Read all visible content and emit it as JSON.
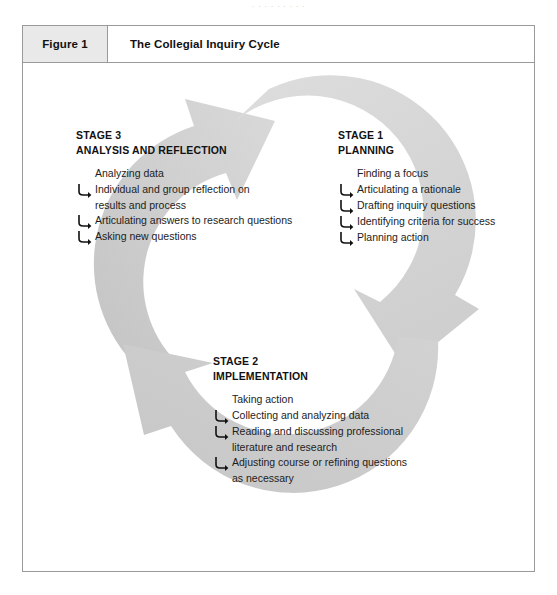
{
  "page": {
    "top_sliver_text": "· · · · · · · · ·",
    "background": "#ffffff"
  },
  "caption": {
    "number": "Figure 1",
    "title": "The Collegial Inquiry Cycle",
    "number_bg": "#e9e9e9",
    "border_color": "#9a9a9a"
  },
  "colors": {
    "arrow_light": "#d6d6d6",
    "arrow_mid": "#cccccc",
    "arrow_dark": "#b9b9b9",
    "text": "#1d1d1d",
    "heading": "#111111"
  },
  "diagram": {
    "type": "cycle",
    "title": "The Collegial Inquiry Cycle",
    "stages": [
      {
        "id": "stage1",
        "number_label": "STAGE 1",
        "name": "PLANNING",
        "items": [
          {
            "text": "Finding a focus",
            "hook": false
          },
          {
            "text": "Articulating a rationale",
            "hook": true
          },
          {
            "text": "Drafting inquiry questions",
            "hook": true
          },
          {
            "text": "Identifying criteria for success",
            "hook": true
          },
          {
            "text": "Planning action",
            "hook": true
          }
        ]
      },
      {
        "id": "stage2",
        "number_label": "STAGE 2",
        "name": "IMPLEMENTATION",
        "items": [
          {
            "text": "Taking action",
            "hook": false
          },
          {
            "text": "Collecting and analyzing data",
            "hook": true
          },
          {
            "text": "Reading and discussing professional",
            "cont": "literature and research",
            "hook": true
          },
          {
            "text": "Adjusting course or refining questions",
            "cont": "as necessary",
            "hook": true
          }
        ]
      },
      {
        "id": "stage3",
        "number_label": "STAGE 3",
        "name": "ANALYSIS AND REFLECTION",
        "items": [
          {
            "text": "Analyzing data",
            "hook": false
          },
          {
            "text": "Individual and group reflection on",
            "cont": "results and process",
            "hook": true
          },
          {
            "text": "Articulating answers to research questions",
            "hook": true
          },
          {
            "text": "Asking new questions",
            "hook": true
          }
        ]
      }
    ]
  }
}
